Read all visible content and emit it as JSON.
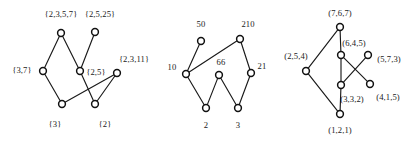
{
  "figure": {
    "background_color": "#ffffff",
    "node_fill": "#ffffff",
    "node_stroke": "#111111",
    "edge_color": "#1a1a1a",
    "label_color": "#1a1a1a"
  },
  "diagrams": [
    {
      "id": "diagram-1",
      "name": "set-lattice",
      "nodes": [
        {
          "id": "d1n0",
          "label": "{2,3,5,7}",
          "cx": 61,
          "cy": 33,
          "lx": 61,
          "ly": 14
        },
        {
          "id": "d1n1",
          "label": "{2,5,25}",
          "cx": 95,
          "cy": 32,
          "lx": 100,
          "ly": 14
        },
        {
          "id": "d1n2",
          "label": "{3,7}",
          "cx": 43,
          "cy": 71,
          "lx": 22,
          "ly": 70
        },
        {
          "id": "d1n3",
          "label": "{2,5}",
          "cx": 80,
          "cy": 71,
          "lx": 96,
          "ly": 72
        },
        {
          "id": "d1n4",
          "label": "{2,3,11}",
          "cx": 117,
          "cy": 73,
          "lx": 134,
          "ly": 59
        },
        {
          "id": "d1n5",
          "label": "{3}",
          "cx": 62,
          "cy": 104,
          "lx": 55,
          "ly": 124
        },
        {
          "id": "d1n6",
          "label": "{2}",
          "cx": 95,
          "cy": 104,
          "lx": 105,
          "ly": 124
        }
      ],
      "edges": [
        [
          "d1n0",
          "d1n2"
        ],
        [
          "d1n0",
          "d1n3"
        ],
        [
          "d1n1",
          "d1n3"
        ],
        [
          "d1n2",
          "d1n5"
        ],
        [
          "d1n3",
          "d1n6"
        ],
        [
          "d1n4",
          "d1n5"
        ],
        [
          "d1n4",
          "d1n6"
        ]
      ]
    },
    {
      "id": "diagram-2",
      "name": "number-lattice",
      "nodes": [
        {
          "id": "d2n0",
          "label": "50",
          "cx": 201,
          "cy": 41,
          "lx": 201,
          "ly": 24
        },
        {
          "id": "d2n1",
          "label": "210",
          "cx": 240,
          "cy": 39,
          "lx": 248,
          "ly": 24
        },
        {
          "id": "d2n2",
          "label": "10",
          "cx": 186,
          "cy": 74,
          "lx": 172,
          "ly": 67
        },
        {
          "id": "d2n3",
          "label": "66",
          "cx": 219,
          "cy": 75,
          "lx": 221,
          "ly": 62
        },
        {
          "id": "d2n4",
          "label": "21",
          "cx": 251,
          "cy": 73,
          "lx": 262,
          "ly": 66
        },
        {
          "id": "d2n5",
          "label": "2",
          "cx": 206,
          "cy": 108,
          "lx": 206,
          "ly": 125
        },
        {
          "id": "d2n6",
          "label": "3",
          "cx": 238,
          "cy": 108,
          "lx": 238,
          "ly": 125
        }
      ],
      "edges": [
        [
          "d2n0",
          "d2n2"
        ],
        [
          "d2n1",
          "d2n2"
        ],
        [
          "d2n1",
          "d2n4"
        ],
        [
          "d2n2",
          "d2n5"
        ],
        [
          "d2n3",
          "d2n5"
        ],
        [
          "d2n3",
          "d2n6"
        ],
        [
          "d2n4",
          "d2n6"
        ]
      ]
    },
    {
      "id": "diagram-3",
      "name": "tuple-lattice",
      "nodes": [
        {
          "id": "d3n0",
          "label": "(7,6,7)",
          "cx": 340,
          "cy": 27,
          "lx": 340,
          "ly": 13
        },
        {
          "id": "d3n1",
          "label": "(2,5,4)",
          "cx": 306,
          "cy": 71,
          "lx": 296,
          "ly": 56
        },
        {
          "id": "d3n2",
          "label": "(6,4,5)",
          "cx": 341,
          "cy": 55,
          "lx": 354,
          "ly": 43
        },
        {
          "id": "d3n3",
          "label": "(5,7,3)",
          "cx": 368,
          "cy": 55,
          "lx": 389,
          "ly": 59
        },
        {
          "id": "d3n4",
          "label": "(3,3,2)",
          "cx": 341,
          "cy": 85,
          "lx": 352,
          "ly": 99
        },
        {
          "id": "d3n5",
          "label": "(4,1,5)",
          "cx": 370,
          "cy": 84,
          "lx": 388,
          "ly": 97
        },
        {
          "id": "d3n6",
          "label": "(1,2,1)",
          "cx": 340,
          "cy": 114,
          "lx": 340,
          "ly": 130
        }
      ],
      "edges": [
        [
          "d3n0",
          "d3n1"
        ],
        [
          "d3n0",
          "d3n2"
        ],
        [
          "d3n2",
          "d3n4"
        ],
        [
          "d3n2",
          "d3n5"
        ],
        [
          "d3n3",
          "d3n4"
        ],
        [
          "d3n4",
          "d3n6"
        ],
        [
          "d3n1",
          "d3n6"
        ]
      ]
    }
  ],
  "node_radius": 3.4
}
